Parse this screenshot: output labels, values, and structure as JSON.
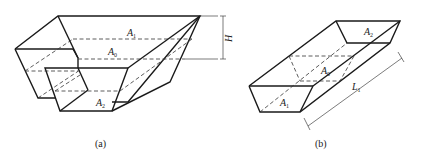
{
  "figure": {
    "panels": [
      {
        "id": "a",
        "caption": "(a)",
        "labels": {
          "top_area": "A1",
          "mid_area": "A0",
          "bottom_area": "A2",
          "height": "H"
        }
      },
      {
        "id": "b",
        "caption": "(b)",
        "labels": {
          "end_area_1": "A1",
          "mid_area": "A0",
          "end_area_2": "A2",
          "length": "L1"
        }
      }
    ],
    "label_parts": {
      "A": "A",
      "sub1": "1",
      "sub0": "0",
      "sub2": "2",
      "H": "H",
      "L": "L",
      "subL": "1"
    }
  }
}
